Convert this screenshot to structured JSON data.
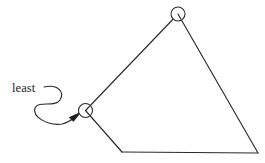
{
  "figure": {
    "background_color": "#ffffff",
    "stroke_color": "#2b2b2b",
    "text_color": "#1d1d1d",
    "width": 265,
    "height": 163
  },
  "annotation": {
    "label": "least",
    "label_x": 12,
    "label_y": 82,
    "curve_path": "M 44 87 C 58 84, 65 92, 60 100 C 55 108, 38 100, 35 108 C 32 117, 48 126, 62 124 C 68 123, 73 119, 77 116",
    "arrow_head_points": "81,112 69,117.5 73.5,121.5",
    "points_to": "vertex-left"
  },
  "polygon": {
    "fill": "none",
    "vertices": [
      {
        "name": "vertex-left",
        "x": 85.5,
        "y": 110.5,
        "marked": true,
        "radius": 7
      },
      {
        "name": "vertex-top",
        "x": 178,
        "y": 14,
        "marked": true,
        "radius": 7
      },
      {
        "name": "vertex-bottom-right",
        "x": 258,
        "y": 153,
        "marked": false,
        "radius": 0
      },
      {
        "name": "vertex-bottom-left",
        "x": 122,
        "y": 152,
        "marked": false,
        "radius": 0
      }
    ],
    "edges": [
      {
        "name": "edge-left-to-top",
        "path": "M 85.5 110.5 L 178 14"
      },
      {
        "name": "edge-top-to-bottom-right",
        "path": "M 178 14 L 258 153"
      },
      {
        "name": "edge-bottom",
        "path": "M 258 153 L 122 152"
      },
      {
        "name": "edge-bottom-left-to-left",
        "path": "M 122 152 L 85.5 110.5"
      }
    ]
  }
}
